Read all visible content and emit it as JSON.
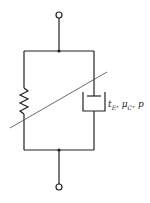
{
  "diagram": {
    "type": "rheological-model",
    "elements": [
      {
        "name": "spring",
        "kind": "resistor-zigzag"
      },
      {
        "name": "dashpot",
        "kind": "damper"
      },
      {
        "name": "variable-slash",
        "kind": "diagonal-line"
      }
    ],
    "label": {
      "t_symbol": "t",
      "t_sub": "E",
      "mu_symbol": "μ",
      "mu_sub": "C",
      "sep": ", ",
      "p_symbol": "p"
    }
  }
}
